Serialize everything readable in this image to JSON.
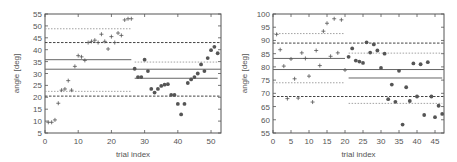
{
  "chart_data": [
    {
      "type": "scatter",
      "title": "",
      "xlabel": "trial index",
      "ylabel": "angle [deg]",
      "xlim": [
        0,
        53
      ],
      "ylim": [
        5,
        55
      ],
      "xticks": [
        0,
        10,
        20,
        30,
        40,
        50
      ],
      "yticks": [
        5,
        10,
        15,
        20,
        25,
        30,
        35,
        40,
        45,
        50,
        55
      ],
      "grid": false,
      "series": [
        {
          "name": "plus",
          "marker": "plus",
          "x": [
            1,
            2,
            3,
            4,
            5,
            6,
            7,
            8,
            9,
            10,
            11,
            12,
            13,
            14,
            15,
            16,
            17,
            18,
            19,
            20,
            21,
            22,
            23,
            24,
            25,
            26
          ],
          "y": [
            9.5,
            9.5,
            10.5,
            17.5,
            23,
            23.5,
            27,
            23,
            33,
            37.5,
            37,
            35.5,
            43,
            43.5,
            44,
            43,
            46.5,
            43.5,
            40.3,
            45.5,
            43,
            47,
            46,
            52.5,
            53,
            53
          ]
        },
        {
          "name": "circle",
          "marker": "circle",
          "x": [
            27,
            28,
            29,
            30,
            31,
            32,
            33,
            34,
            35,
            36,
            37,
            38,
            39,
            40,
            41,
            42,
            43,
            44,
            45,
            46,
            47,
            48,
            49,
            50,
            51,
            52
          ],
          "y": [
            32,
            28.5,
            28.5,
            35.8,
            31,
            23.5,
            22,
            23.5,
            24.8,
            25.3,
            25.5,
            21,
            21,
            17.2,
            12.8,
            17.2,
            26,
            27.5,
            28.5,
            30,
            33.8,
            31,
            36.5,
            39.8,
            41.2,
            38.5
          ]
        }
      ],
      "lines": [
        {
          "style": "solid",
          "y": 31.8,
          "x": [
            0,
            53
          ]
        },
        {
          "style": "dashed",
          "y": 43.0,
          "x": [
            0,
            53
          ]
        },
        {
          "style": "dashed",
          "y": 20.5,
          "x": [
            0,
            53
          ]
        },
        {
          "style": "solid",
          "y": 35.8,
          "x": [
            0,
            26
          ]
        },
        {
          "style": "dotted",
          "y": 48.8,
          "x": [
            0,
            26
          ]
        },
        {
          "style": "dotted",
          "y": 22.5,
          "x": [
            0,
            26
          ]
        },
        {
          "style": "solid",
          "y": 28.0,
          "x": [
            27,
            52
          ]
        },
        {
          "style": "dotted",
          "y": 34.8,
          "x": [
            27,
            52
          ]
        }
      ]
    },
    {
      "type": "scatter",
      "title": "",
      "xlabel": "trial index",
      "ylabel": "angle [deg]",
      "xlim": [
        0,
        47.5
      ],
      "ylim": [
        55,
        100
      ],
      "xticks": [
        0,
        5,
        10,
        15,
        20,
        25,
        30,
        35,
        40,
        45
      ],
      "yticks": [
        55,
        60,
        65,
        70,
        75,
        80,
        85,
        90,
        95,
        100
      ],
      "grid": false,
      "series": [
        {
          "name": "plus",
          "marker": "plus",
          "x": [
            1,
            2,
            3,
            4,
            5,
            6,
            7,
            8,
            9,
            10,
            11,
            12,
            13,
            14,
            15,
            16,
            17,
            18,
            19,
            20
          ],
          "y": [
            92.3,
            86.5,
            80.3,
            68,
            83,
            75.5,
            68.2,
            85.3,
            83.2,
            76.5,
            66.7,
            86.2,
            80.5,
            93.5,
            96.5,
            84,
            98.2,
            85.3,
            97.8,
            78.8
          ]
        },
        {
          "name": "circle",
          "marker": "circle",
          "x": [
            21,
            22,
            23,
            24,
            25,
            26,
            27,
            28,
            29,
            30,
            31,
            32,
            33,
            34,
            35,
            36,
            37,
            38,
            39,
            40,
            41,
            42,
            43,
            44,
            45,
            46,
            47
          ],
          "y": [
            83.8,
            87,
            82.4,
            82,
            81.5,
            89.3,
            85.4,
            88.5,
            86.2,
            79.6,
            85,
            67.8,
            73.3,
            66.8,
            78.5,
            58.2,
            72.3,
            67.1,
            81.3,
            68.8,
            81,
            61.8,
            81.8,
            68.8,
            61,
            65.3,
            62.2
          ]
        }
      ],
      "lines": [
        {
          "style": "solid",
          "y": 79.0,
          "x": [
            0,
            47.5
          ]
        },
        {
          "style": "dashed",
          "y": 89.0,
          "x": [
            0,
            47.5
          ]
        },
        {
          "style": "dashed",
          "y": 68.8,
          "x": [
            0,
            47.5
          ]
        },
        {
          "style": "solid",
          "y": 83.2,
          "x": [
            0,
            20
          ]
        },
        {
          "style": "dotted",
          "y": 92.6,
          "x": [
            0,
            20
          ]
        },
        {
          "style": "dotted",
          "y": 74.0,
          "x": [
            0,
            20
          ]
        },
        {
          "style": "solid",
          "y": 75.8,
          "x": [
            21,
            47
          ]
        },
        {
          "style": "dotted",
          "y": 85.2,
          "x": [
            21,
            47
          ]
        },
        {
          "style": "dotted",
          "y": 66.2,
          "x": [
            21,
            47
          ]
        }
      ]
    }
  ],
  "layout": [
    {
      "px_left": 45,
      "px_right": 221,
      "px_top": 14,
      "px_bottom": 133
    },
    {
      "px_left": 273,
      "px_right": 444,
      "px_top": 14,
      "px_bottom": 133
    }
  ],
  "colors": {
    "axis": "#555555",
    "solid": "#666666",
    "dashed": "#444444",
    "dotted": "#999999",
    "marker": "#555555"
  }
}
